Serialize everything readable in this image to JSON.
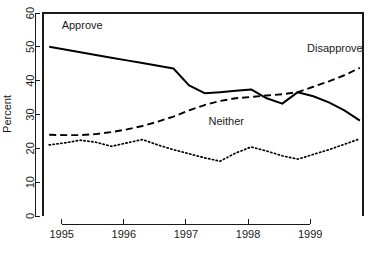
{
  "chart_data": {
    "type": "line",
    "title": "",
    "subtitle": "",
    "xlabel": "",
    "ylabel": "Percent",
    "xlim": [
      1994.7,
      1999.85
    ],
    "ylim": [
      0,
      60
    ],
    "grid": false,
    "legend_position": "inline-annotations",
    "xticks": [
      1995,
      1996,
      1997,
      1998,
      1999
    ],
    "xtick_labels": [
      "1995",
      "1996",
      "1997",
      "1998",
      "1999"
    ],
    "yticks": [
      0,
      10,
      20,
      30,
      40,
      50,
      60
    ],
    "ytick_labels": [
      "0",
      "10",
      "20",
      "30",
      "40",
      "50",
      "60"
    ],
    "x": [
      1994.8,
      1995.05,
      1995.3,
      1995.55,
      1995.8,
      1996.05,
      1996.3,
      1996.55,
      1996.8,
      1997.05,
      1997.3,
      1997.55,
      1997.8,
      1998.05,
      1998.3,
      1998.55,
      1998.8,
      1999.05,
      1999.3,
      1999.55,
      1999.8
    ],
    "series": [
      {
        "name": "Approve",
        "style": "solid",
        "color": "#000000",
        "values": [
          50.0,
          49.2,
          48.4,
          47.6,
          46.8,
          46.0,
          45.2,
          44.4,
          43.6,
          38.6,
          36.3,
          36.6,
          37.0,
          37.4,
          34.8,
          33.2,
          36.6,
          35.4,
          33.6,
          31.2,
          28.2
        ]
      },
      {
        "name": "Disapprove",
        "style": "dashed",
        "color": "#000000",
        "values": [
          24.0,
          23.9,
          23.9,
          24.2,
          24.8,
          25.6,
          26.6,
          27.9,
          29.4,
          31.2,
          32.8,
          34.0,
          34.8,
          35.2,
          35.6,
          36.0,
          36.6,
          38.2,
          39.8,
          41.6,
          43.8
        ]
      },
      {
        "name": "Neither",
        "style": "dotted",
        "color": "#000000",
        "values": [
          21.0,
          21.6,
          22.4,
          21.8,
          20.6,
          21.6,
          22.6,
          21.0,
          19.6,
          18.4,
          17.2,
          16.2,
          18.6,
          20.4,
          19.2,
          17.8,
          16.8,
          18.2,
          19.6,
          21.2,
          22.8
        ]
      }
    ],
    "annotations": [
      {
        "text": "Approve",
        "x": 1995.0,
        "y": 55.2,
        "anchor": "start"
      },
      {
        "text": "Disapprove",
        "x": 1998.95,
        "y": 48.4,
        "anchor": "start"
      },
      {
        "text": "Neither",
        "x": 1997.65,
        "y": 26.8,
        "anchor": "middle"
      }
    ]
  }
}
